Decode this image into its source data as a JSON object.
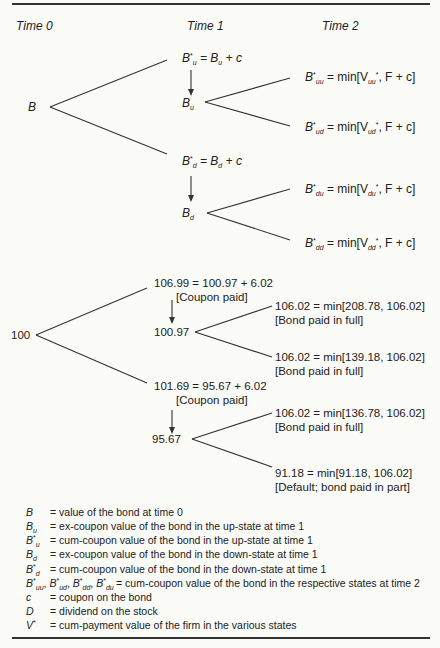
{
  "headers": {
    "t0": "Time 0",
    "t1": "Time 1",
    "t2": "Time 2"
  },
  "symbolic": {
    "root": "B",
    "up_cum": {
      "lhs": "B",
      "lhs_sub": "u",
      "rhs": "= B",
      "rhs_sub": "u",
      "tail": "+ c"
    },
    "up_ex": {
      "base": "B",
      "sub": "u"
    },
    "down_cum": {
      "lhs": "B",
      "lhs_sub": "d",
      "rhs": "= B",
      "rhs_sub": "d",
      "tail": "+ c"
    },
    "down_ex": {
      "base": "B",
      "sub": "d"
    },
    "uu": {
      "sub": "uu",
      "expr": "= min[V",
      "vsub": "uu",
      "tail": ", F + c]"
    },
    "ud": {
      "sub": "ud",
      "expr": "= min[V",
      "vsub": "ud",
      "tail": ", F + c]"
    },
    "du": {
      "sub": "du",
      "expr": "= min[V",
      "vsub": "du",
      "tail": ", F + c]"
    },
    "dd": {
      "sub": "dd",
      "expr": "= min[V",
      "vsub": "dd",
      "tail": ", F + c]"
    }
  },
  "numeric": {
    "root": "100",
    "up_cum": "106.99 = 100.97 + 6.02",
    "up_cum_note": "[Coupon paid]",
    "up_ex": "100.97",
    "down_cum": "101.69 = 95.67 + 6.02",
    "down_cum_note": "[Coupon paid]",
    "down_ex": "95.67",
    "uu": "106.02 = min[208.78, 106.02]",
    "uu_note": "[Bond paid in full]",
    "ud": "106.02 = min[139.18, 106.02]",
    "ud_note": "[Bond paid in full]",
    "du": "106.02 = min[136.78, 106.02]",
    "du_note": "[Bond paid in full]",
    "dd": "91.18 = min[91.18, 106.02]",
    "dd_note": "[Default; bond paid in part]"
  },
  "legend": [
    {
      "key": "B",
      "sub": "",
      "star": "",
      "text": "= value of the bond at time 0"
    },
    {
      "key": "B",
      "sub": "u",
      "star": "",
      "text": "= ex-coupon value of the bond in the up-state at time 1"
    },
    {
      "key": "B",
      "sub": "u",
      "star": "*",
      "text": "= cum-coupon value of the bond in the up-state at time 1"
    },
    {
      "key": "B",
      "sub": "d",
      "star": "",
      "text": "= ex-coupon value of the bond in the down-state at time 1"
    },
    {
      "key": "B",
      "sub": "d",
      "star": "*",
      "text": "= cum-coupon value of the bond in the down-state at time 1"
    },
    {
      "key": "B*uu, B*ud, B*dd, B*du",
      "sub": "",
      "star": "",
      "text": "= cum-coupon value of the bond in the respective states at time 2"
    },
    {
      "key": "c",
      "sub": "",
      "star": "",
      "text": "= coupon on the bond"
    },
    {
      "key": "D",
      "sub": "",
      "star": "",
      "text": "= dividend on the stock"
    },
    {
      "key": "V*",
      "sub": "",
      "star": "",
      "text": "= cum-payment value of the firm in the various states"
    }
  ]
}
